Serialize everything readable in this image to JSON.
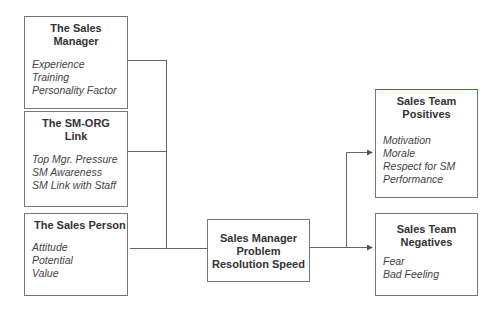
{
  "boxes": {
    "sales_manager": {
      "title": "The Sales Manager",
      "title_lines": [
        "The Sales",
        "Manager"
      ],
      "items": [
        "Experience",
        "Training",
        "Personality Factor"
      ]
    },
    "sm_org_link": {
      "title_lines": [
        "The SM-ORG",
        "Link"
      ],
      "items": [
        "Top Mgr. Pressure",
        "SM Awareness",
        "SM Link with Staff"
      ]
    },
    "sales_person": {
      "title_lines": [
        "The Sales Person"
      ],
      "items": [
        "Attitude",
        "Potential",
        "Value"
      ]
    },
    "resolution_speed": {
      "title_lines": [
        "Sales Manager",
        "Problem",
        "Resolution Speed"
      ]
    },
    "positives": {
      "title_lines": [
        "Sales Team",
        "Positives"
      ],
      "items": [
        "Motivation",
        "Morale",
        "Respect for SM",
        "Performance"
      ]
    },
    "negatives": {
      "title_lines": [
        "Sales Team",
        "Negatives"
      ],
      "items": [
        "Fear",
        "Bad Feeling"
      ]
    }
  },
  "colors": {
    "line": "#666666",
    "border": "#777777",
    "accent_top": "#c0392b"
  }
}
